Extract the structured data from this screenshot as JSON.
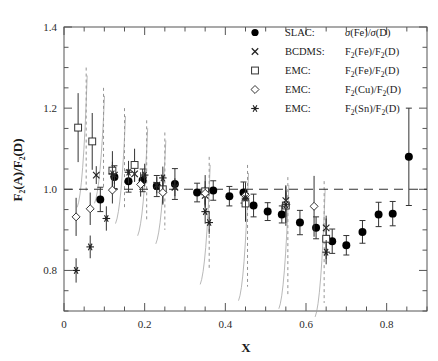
{
  "figure": {
    "xlabel": "X",
    "ylabel_parts": [
      "F",
      "2",
      "(A)/F",
      "2",
      "(D)"
    ],
    "ylabel_plain": "F2(A)/F2(D)"
  },
  "axes": {
    "x_ticklabels": [
      "0",
      "0.2",
      "0.4",
      "0.6",
      "0.8"
    ],
    "x_tickvalues": [
      0,
      0.2,
      0.4,
      0.6,
      0.8
    ],
    "y_ticklabels": [
      "0.8",
      "1.0",
      "1.2",
      "1.4"
    ],
    "y_tickvalues": [
      0.8,
      1.0,
      1.2,
      1.4
    ],
    "xlim": [
      0,
      0.9
    ],
    "ylim": [
      0.7,
      1.4
    ],
    "x_minor_step": 0.05,
    "y_minor_step": 0.05,
    "grid": false,
    "reference_line_y": 1.0,
    "reference_line_style": "dashed"
  },
  "legend": {
    "position": "top-right",
    "entries": [
      {
        "marker": "filled-circle",
        "experiment": "SLAC:",
        "ratio": "σ(Fe)/σ(D)",
        "ratio_html": "<tspan class='it'>σ</tspan>(Fe)/<tspan class='it'>σ</tspan>(D)"
      },
      {
        "marker": "cross",
        "experiment": "BCDMS:",
        "ratio": "F2(Fe)/F2(D)",
        "ratio_html": "F<tspan class='sub' dy='3'>2</tspan><tspan dy='-3'>(Fe)/F</tspan><tspan class='sub' dy='3'>2</tspan><tspan dy='-3'>(D)</tspan>"
      },
      {
        "marker": "open-square",
        "experiment": "EMC:",
        "ratio": "F2(Fe)/F2(D)",
        "ratio_html": "F<tspan class='sub' dy='3'>2</tspan><tspan dy='-3'>(Fe)/F</tspan><tspan class='sub' dy='3'>2</tspan><tspan dy='-3'>(D)</tspan>"
      },
      {
        "marker": "open-diamond",
        "experiment": "EMC:",
        "ratio": "F2(Cu)/F2(D)",
        "ratio_html": "F<tspan class='sub' dy='3'>2</tspan><tspan dy='-3'>(Cu)/F</tspan><tspan class='sub' dy='3'>2</tspan><tspan dy='-3'>(D)</tspan>"
      },
      {
        "marker": "asterisk",
        "experiment": "EMC:",
        "ratio": "F2(Sn)/F2(D)",
        "ratio_html": "F<tspan class='sub' dy='3'>2</tspan><tspan dy='-3'>(Sn)/F</tspan><tspan class='sub' dy='3'>2</tspan><tspan dy='-3'>(D)</tspan>"
      }
    ]
  },
  "chart_data": {
    "type": "scatter",
    "title": "",
    "xlabel": "X",
    "ylabel": "F2(A)/F2(D)",
    "xlim": [
      0,
      0.9
    ],
    "ylim": [
      0.7,
      1.4
    ],
    "grid": false,
    "legend_position": "top-right",
    "reference_line": {
      "y": 1.0,
      "style": "dashed"
    },
    "series": [
      {
        "name": "SLAC: σ(Fe)/σ(D)",
        "marker": "filled-circle",
        "points": [
          {
            "x": 0.09,
            "y": 0.975,
            "yerr": 0.03
          },
          {
            "x": 0.125,
            "y": 1.03,
            "yerr": 0.028
          },
          {
            "x": 0.16,
            "y": 1.02,
            "yerr": 0.027
          },
          {
            "x": 0.195,
            "y": 1.022,
            "yerr": 0.028
          },
          {
            "x": 0.23,
            "y": 1.008,
            "yerr": 0.026
          },
          {
            "x": 0.275,
            "y": 1.013,
            "yerr": 0.038
          },
          {
            "x": 0.33,
            "y": 0.992,
            "yerr": 0.023
          },
          {
            "x": 0.37,
            "y": 0.997,
            "yerr": 0.024
          },
          {
            "x": 0.41,
            "y": 0.983,
            "yerr": 0.024
          },
          {
            "x": 0.445,
            "y": 0.992,
            "yerr": 0.026
          },
          {
            "x": 0.47,
            "y": 0.96,
            "yerr": 0.028
          },
          {
            "x": 0.505,
            "y": 0.945,
            "yerr": 0.022
          },
          {
            "x": 0.54,
            "y": 0.938,
            "yerr": 0.021
          },
          {
            "x": 0.585,
            "y": 0.918,
            "yerr": 0.03
          },
          {
            "x": 0.625,
            "y": 0.905,
            "yerr": 0.027
          },
          {
            "x": 0.665,
            "y": 0.872,
            "yerr": 0.03
          },
          {
            "x": 0.7,
            "y": 0.862,
            "yerr": 0.024
          },
          {
            "x": 0.74,
            "y": 0.895,
            "yerr": 0.028
          },
          {
            "x": 0.78,
            "y": 0.938,
            "yerr": 0.03
          },
          {
            "x": 0.815,
            "y": 0.94,
            "yerr": 0.03
          },
          {
            "x": 0.855,
            "y": 1.08,
            "yerr": 0.12
          }
        ]
      },
      {
        "name": "BCDMS: F2(Fe)/F2(D)",
        "marker": "cross",
        "points": [
          {
            "x": 0.08,
            "y": 1.035,
            "yerr": 0.022
          },
          {
            "x": 0.125,
            "y": 1.035,
            "yerr": 0.022
          },
          {
            "x": 0.175,
            "y": 1.038,
            "yerr": 0.02
          },
          {
            "x": 0.23,
            "y": 1.01,
            "yerr": 0.02
          },
          {
            "x": 0.275,
            "y": 1.005,
            "yerr": 0.022
          },
          {
            "x": 0.35,
            "y": 0.985,
            "yerr": 0.022
          },
          {
            "x": 0.45,
            "y": 0.982,
            "yerr": 0.022
          },
          {
            "x": 0.55,
            "y": 0.972,
            "yerr": 0.025
          },
          {
            "x": 0.65,
            "y": 0.905,
            "yerr": 0.03
          }
        ]
      },
      {
        "name": "EMC: F2(Fe)/F2(D)",
        "marker": "open-square",
        "points": [
          {
            "x": 0.035,
            "y": 1.152,
            "yerr": 0.085
          },
          {
            "x": 0.07,
            "y": 1.118,
            "yerr": 0.07
          },
          {
            "x": 0.12,
            "y": 1.046,
            "yerr": 0.048
          },
          {
            "x": 0.175,
            "y": 1.06,
            "yerr": 0.04
          },
          {
            "x": 0.245,
            "y": 1.0,
            "yerr": 0.035
          },
          {
            "x": 0.35,
            "y": 0.995,
            "yerr": 0.04
          },
          {
            "x": 0.45,
            "y": 0.965,
            "yerr": 0.045
          },
          {
            "x": 0.55,
            "y": 0.96,
            "yerr": 0.05
          },
          {
            "x": 0.65,
            "y": 0.878,
            "yerr": 0.05
          }
        ]
      },
      {
        "name": "EMC: F2(Cu)/F2(D)",
        "marker": "open-diamond",
        "points": [
          {
            "x": 0.03,
            "y": 0.932,
            "yerr": 0.047
          },
          {
            "x": 0.065,
            "y": 0.952,
            "yerr": 0.04
          },
          {
            "x": 0.12,
            "y": 0.998,
            "yerr": 0.033
          },
          {
            "x": 0.19,
            "y": 1.012,
            "yerr": 0.03
          },
          {
            "x": 0.245,
            "y": 0.992,
            "yerr": 0.03
          },
          {
            "x": 0.35,
            "y": 0.99,
            "yerr": 0.03
          },
          {
            "x": 0.45,
            "y": 0.985,
            "yerr": 0.032
          },
          {
            "x": 0.55,
            "y": 0.962,
            "yerr": 0.045
          },
          {
            "x": 0.62,
            "y": 0.958,
            "yerr": 0.075
          }
        ]
      },
      {
        "name": "EMC: F2(Sn)/F2(D)",
        "marker": "asterisk",
        "points": [
          {
            "x": 0.03,
            "y": 0.8,
            "yerr": 0.03
          },
          {
            "x": 0.065,
            "y": 0.858,
            "yerr": 0.028
          },
          {
            "x": 0.105,
            "y": 0.928,
            "yerr": 0.03
          },
          {
            "x": 0.12,
            "y": 1.038,
            "yerr": 0.03
          },
          {
            "x": 0.16,
            "y": 1.042,
            "yerr": 0.028
          },
          {
            "x": 0.2,
            "y": 1.035,
            "yerr": 0.028
          },
          {
            "x": 0.245,
            "y": 1.028,
            "yerr": 0.028
          },
          {
            "x": 0.35,
            "y": 0.945,
            "yerr": 0.03
          },
          {
            "x": 0.36,
            "y": 0.918,
            "yerr": 0.028
          },
          {
            "x": 0.45,
            "y": 0.978,
            "yerr": 0.028
          },
          {
            "x": 0.55,
            "y": 0.962,
            "yerr": 0.03
          },
          {
            "x": 0.65,
            "y": 0.845,
            "yerr": 0.03
          }
        ]
      }
    ],
    "systematic_bands": [
      {
        "x": 0.055,
        "y_top": 1.3,
        "y_bottom": 0.99
      },
      {
        "x": 0.098,
        "y_top": 1.25,
        "y_bottom": 1.0
      },
      {
        "x": 0.15,
        "y_top": 1.2,
        "y_bottom": 0.95
      },
      {
        "x": 0.205,
        "y_top": 1.17,
        "y_bottom": 0.92
      },
      {
        "x": 0.25,
        "y_top": 1.14,
        "y_bottom": 0.9
      },
      {
        "x": 0.36,
        "y_top": 1.08,
        "y_bottom": 0.8
      },
      {
        "x": 0.455,
        "y_top": 1.06,
        "y_bottom": 0.76
      },
      {
        "x": 0.555,
        "y_top": 1.03,
        "y_bottom": 0.74
      },
      {
        "x": 0.645,
        "y_top": 1.02,
        "y_bottom": 0.72
      }
    ]
  }
}
